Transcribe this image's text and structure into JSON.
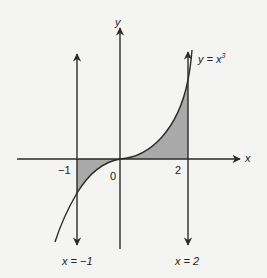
{
  "diagram": {
    "curve_label_prefix": "y = x",
    "curve_label_exp": "3",
    "axis_x_label": "x",
    "axis_y_label": "y",
    "tick_neg1": "−1",
    "tick_0": "0",
    "tick_2": "2",
    "line_left_label": "x = −1",
    "line_right_label": "x = 2",
    "colors": {
      "line": "#2a2a2a",
      "fill": "#a9a9a9",
      "background": "#f4f4f2"
    }
  }
}
